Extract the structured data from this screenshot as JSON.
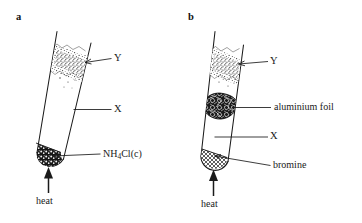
{
  "figure": {
    "background_color": "#ffffff",
    "ink_color": "#1a1a1a"
  },
  "panels": [
    {
      "id": "a",
      "letter": "a",
      "tube": {
        "name": "test-tube-a",
        "orientation": "tilted",
        "contents": [
          {
            "name": "vapour-cloud-y",
            "style": "stippled",
            "label_ref": "Y"
          },
          {
            "name": "solid-at-base",
            "style": "dark-granular",
            "label_ref": "NH4Cl(c)"
          }
        ]
      },
      "labels": [
        {
          "key": "y",
          "text": "Y",
          "target": "vapour-cloud-y"
        },
        {
          "key": "x",
          "text": "X",
          "target": "tube-wall"
        },
        {
          "key": "solid",
          "text_html": "NH<sub>4</sub>Cl(c)",
          "text_plain": "NH4Cl(c)",
          "target": "solid-at-base"
        },
        {
          "key": "heat",
          "text": "heat",
          "target": "heat-arrow"
        }
      ]
    },
    {
      "id": "b",
      "letter": "b",
      "tube": {
        "name": "test-tube-b",
        "orientation": "tilted",
        "contents": [
          {
            "name": "vapour-cloud-y",
            "style": "stippled",
            "label_ref": "Y"
          },
          {
            "name": "aluminium-foil-plug",
            "style": "dark-crumpled",
            "label_ref": "aluminium foil"
          },
          {
            "name": "liquid-at-base",
            "style": "cross-hatched",
            "label_ref": "bromine"
          }
        ]
      },
      "labels": [
        {
          "key": "y",
          "text": "Y",
          "target": "vapour-cloud-y"
        },
        {
          "key": "foil",
          "text": "aluminium foil",
          "target": "aluminium-foil-plug"
        },
        {
          "key": "x",
          "text": "X",
          "target": "tube-wall"
        },
        {
          "key": "bromine",
          "text": "bromine",
          "target": "liquid-at-base"
        },
        {
          "key": "heat",
          "text": "heat",
          "target": "heat-arrow"
        }
      ]
    }
  ],
  "text": {
    "panel_a_letter": "a",
    "panel_b_letter": "b",
    "a_label_y": "Y",
    "a_label_x": "X",
    "a_label_solid_prefix": "NH",
    "a_label_solid_sub": "4",
    "a_label_solid_suffix": "Cl(c)",
    "a_label_heat": "heat",
    "b_label_y": "Y",
    "b_label_foil": "aluminium foil",
    "b_label_x": "X",
    "b_label_bromine": "bromine",
    "b_label_heat": "heat"
  }
}
